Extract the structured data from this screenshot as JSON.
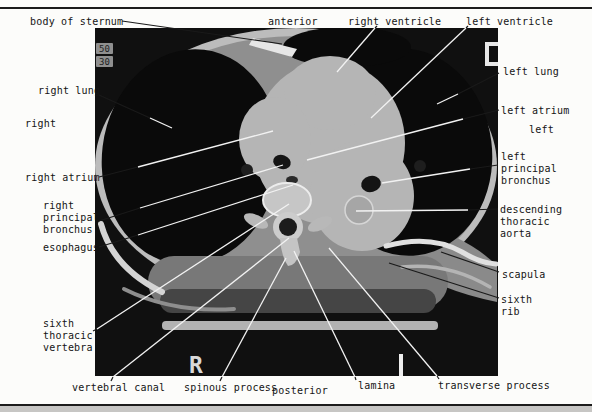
{
  "figure": {
    "background": "#fcfcfa",
    "rule_color": "#1c1c1c",
    "footer_band_color": "#c7c6c4"
  },
  "colors": {
    "line_dark": "#1a1a1a",
    "line_light": "#f2f2f2",
    "label_text": "#141414"
  },
  "ct_scan": {
    "markers": {
      "value_top": "50",
      "value_bottom": "30",
      "right_marker": "R",
      "c_marker": "C"
    }
  },
  "labels": [
    {
      "id": "body-of-sternum",
      "kind": "structure",
      "text": "body of sternum",
      "x": 30,
      "y": 16
    },
    {
      "id": "anterior",
      "kind": "orientation",
      "text": "anterior",
      "x": 268,
      "y": 16
    },
    {
      "id": "right-ventricle",
      "kind": "structure",
      "text": "right ventricle",
      "x": 348,
      "y": 16
    },
    {
      "id": "left-ventricle",
      "kind": "structure",
      "text": "left ventricle",
      "x": 466,
      "y": 16
    },
    {
      "id": "right-lung",
      "kind": "structure",
      "text": "right lung",
      "x": 38,
      "y": 85
    },
    {
      "id": "right",
      "kind": "orientation",
      "text": "right",
      "x": 25,
      "y": 118
    },
    {
      "id": "right-atrium",
      "kind": "structure",
      "text": "right atrium",
      "x": 25,
      "y": 172
    },
    {
      "id": "right-principal-bronchus",
      "kind": "structure",
      "text": "right\nprincipal\nbronchus",
      "x": 43,
      "y": 200
    },
    {
      "id": "esophagus",
      "kind": "structure",
      "text": "esophagus",
      "x": 43,
      "y": 242
    },
    {
      "id": "sixth-thoracic-vertebra",
      "kind": "structure",
      "text": "sixth\nthoracic\nvertebra",
      "x": 43,
      "y": 318
    },
    {
      "id": "vertebral-canal",
      "kind": "structure",
      "text": "vertebral canal",
      "x": 72,
      "y": 382
    },
    {
      "id": "spinous-process",
      "kind": "structure",
      "text": "spinous process",
      "x": 184,
      "y": 382
    },
    {
      "id": "posterior",
      "kind": "orientation",
      "text": "posterior",
      "x": 272,
      "y": 385
    },
    {
      "id": "lamina",
      "kind": "structure",
      "text": "lamina",
      "x": 358,
      "y": 380
    },
    {
      "id": "transverse-process",
      "kind": "structure",
      "text": "transverse process",
      "x": 438,
      "y": 380
    },
    {
      "id": "left-lung",
      "kind": "structure",
      "text": "left lung",
      "x": 503,
      "y": 66
    },
    {
      "id": "left-atrium",
      "kind": "structure",
      "text": "left atrium",
      "x": 501,
      "y": 105
    },
    {
      "id": "left",
      "kind": "orientation",
      "text": "left",
      "x": 529,
      "y": 124
    },
    {
      "id": "left-principal-bronchus",
      "kind": "structure",
      "text": "left\nprincipal\nbronchus",
      "x": 501,
      "y": 151
    },
    {
      "id": "descending-thoracic-aorta",
      "kind": "structure",
      "text": "descending\nthoracic\naorta",
      "x": 500,
      "y": 204
    },
    {
      "id": "scapula",
      "kind": "structure",
      "text": "scapula",
      "x": 502,
      "y": 269
    },
    {
      "id": "sixth-rib",
      "kind": "structure",
      "text": "sixth\nrib",
      "x": 501,
      "y": 294
    }
  ],
  "leader_lines": [
    {
      "label": "body-of-sternum",
      "segments": [
        {
          "x1": 122,
          "y1": 21,
          "x2": 282,
          "y2": 44,
          "tone": "dark"
        }
      ]
    },
    {
      "label": "right-ventricle",
      "segments": [
        {
          "x1": 377,
          "y1": 26,
          "x2": 375,
          "y2": 28,
          "tone": "dark"
        },
        {
          "x1": 375,
          "y1": 28,
          "x2": 337,
          "y2": 72,
          "tone": "light"
        }
      ]
    },
    {
      "label": "left-ventricle",
      "segments": [
        {
          "x1": 468,
          "y1": 26,
          "x2": 466,
          "y2": 28,
          "tone": "dark"
        },
        {
          "x1": 466,
          "y1": 28,
          "x2": 371,
          "y2": 118,
          "tone": "light"
        }
      ]
    },
    {
      "label": "right-lung",
      "segments": [
        {
          "x1": 99,
          "y1": 95,
          "x2": 150,
          "y2": 118,
          "tone": "dark"
        },
        {
          "x1": 150,
          "y1": 118,
          "x2": 172,
          "y2": 128,
          "tone": "light"
        }
      ]
    },
    {
      "label": "right-atrium",
      "segments": [
        {
          "x1": 99,
          "y1": 177,
          "x2": 138,
          "y2": 167,
          "tone": "dark"
        },
        {
          "x1": 138,
          "y1": 167,
          "x2": 273,
          "y2": 131,
          "tone": "light"
        }
      ]
    },
    {
      "label": "right-principal-bronchus",
      "segments": [
        {
          "x1": 99,
          "y1": 221,
          "x2": 140,
          "y2": 208,
          "tone": "dark"
        },
        {
          "x1": 140,
          "y1": 208,
          "x2": 283,
          "y2": 165,
          "tone": "light"
        }
      ]
    },
    {
      "label": "esophagus",
      "segments": [
        {
          "x1": 99,
          "y1": 247,
          "x2": 138,
          "y2": 235,
          "tone": "dark"
        },
        {
          "x1": 138,
          "y1": 235,
          "x2": 293,
          "y2": 185,
          "tone": "light"
        }
      ]
    },
    {
      "label": "sixth-thoracic-vertebra",
      "segments": [
        {
          "x1": 93,
          "y1": 331,
          "x2": 97,
          "y2": 329,
          "tone": "dark"
        },
        {
          "x1": 97,
          "y1": 329,
          "x2": 289,
          "y2": 204,
          "tone": "light"
        }
      ]
    },
    {
      "label": "vertebral-canal",
      "segments": [
        {
          "x1": 111,
          "y1": 381,
          "x2": 113,
          "y2": 377,
          "tone": "dark"
        },
        {
          "x1": 113,
          "y1": 377,
          "x2": 289,
          "y2": 238,
          "tone": "light"
        }
      ]
    },
    {
      "label": "spinous-process",
      "segments": [
        {
          "x1": 220,
          "y1": 381,
          "x2": 222,
          "y2": 377,
          "tone": "dark"
        },
        {
          "x1": 222,
          "y1": 377,
          "x2": 286,
          "y2": 258,
          "tone": "light"
        }
      ]
    },
    {
      "label": "lamina",
      "segments": [
        {
          "x1": 356,
          "y1": 380,
          "x2": 355,
          "y2": 377,
          "tone": "dark"
        },
        {
          "x1": 355,
          "y1": 377,
          "x2": 294,
          "y2": 251,
          "tone": "light"
        }
      ]
    },
    {
      "label": "transverse-process",
      "segments": [
        {
          "x1": 439,
          "y1": 379,
          "x2": 437,
          "y2": 376,
          "tone": "dark"
        },
        {
          "x1": 437,
          "y1": 376,
          "x2": 329,
          "y2": 248,
          "tone": "light"
        }
      ]
    },
    {
      "label": "left-lung",
      "segments": [
        {
          "x1": 499,
          "y1": 73,
          "x2": 458,
          "y2": 94,
          "tone": "dark"
        },
        {
          "x1": 458,
          "y1": 94,
          "x2": 437,
          "y2": 104,
          "tone": "light"
        }
      ]
    },
    {
      "label": "left-atrium",
      "segments": [
        {
          "x1": 499,
          "y1": 110,
          "x2": 463,
          "y2": 119,
          "tone": "dark"
        },
        {
          "x1": 463,
          "y1": 119,
          "x2": 307,
          "y2": 160,
          "tone": "light"
        }
      ]
    },
    {
      "label": "left-principal-bronchus",
      "segments": [
        {
          "x1": 498,
          "y1": 165,
          "x2": 470,
          "y2": 169,
          "tone": "dark"
        },
        {
          "x1": 470,
          "y1": 169,
          "x2": 382,
          "y2": 183,
          "tone": "light"
        }
      ]
    },
    {
      "label": "descending-thoracic-aorta",
      "segments": [
        {
          "x1": 498,
          "y1": 209,
          "x2": 468,
          "y2": 210,
          "tone": "dark"
        },
        {
          "x1": 468,
          "y1": 210,
          "x2": 356,
          "y2": 211,
          "tone": "light"
        }
      ]
    },
    {
      "label": "scapula",
      "segments": [
        {
          "x1": 499,
          "y1": 272,
          "x2": 441,
          "y2": 252,
          "tone": "dark"
        }
      ]
    },
    {
      "label": "sixth-rib",
      "segments": [
        {
          "x1": 499,
          "y1": 298,
          "x2": 389,
          "y2": 263,
          "tone": "dark"
        }
      ]
    }
  ]
}
